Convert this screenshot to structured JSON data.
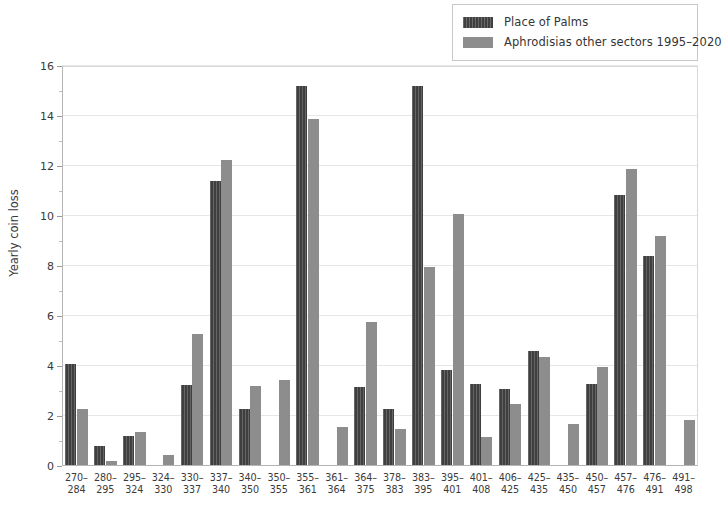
{
  "chart_data": {
    "type": "bar",
    "title": "",
    "xlabel": "",
    "ylabel": "Yearly coin loss",
    "ylim": [
      0,
      16
    ],
    "ytick_step": 2,
    "yticks": [
      0,
      2,
      4,
      6,
      8,
      10,
      12,
      14,
      16
    ],
    "ytick_labels": [
      "0",
      "2",
      "4",
      "6",
      "8",
      "10",
      "12",
      "14",
      "16"
    ],
    "minor_yticks": [
      1,
      3,
      5,
      7,
      9,
      11,
      13,
      15
    ],
    "grid": true,
    "grid_axis": "y",
    "legend_position": "top-right",
    "categories": [
      "270–284",
      "280–295",
      "295–324",
      "324–330",
      "330–337",
      "337–340",
      "340–350",
      "350–355",
      "355–361",
      "361–364",
      "364–375",
      "378–383",
      "383–395",
      "395–401",
      "401–408",
      "406–425",
      "425–435",
      "435–450",
      "450–457",
      "457–476",
      "476–491",
      "491–498"
    ],
    "category_lines": [
      [
        "270–",
        "284"
      ],
      [
        "280–",
        "295"
      ],
      [
        "295–",
        "324"
      ],
      [
        "324–",
        "330"
      ],
      [
        "330–",
        "337"
      ],
      [
        "337–",
        "340"
      ],
      [
        "340–",
        "350"
      ],
      [
        "350–",
        "355"
      ],
      [
        "355–",
        "361"
      ],
      [
        "361–",
        "364"
      ],
      [
        "364–",
        "375"
      ],
      [
        "378–",
        "383"
      ],
      [
        "383–",
        "395"
      ],
      [
        "395–",
        "401"
      ],
      [
        "401–",
        "408"
      ],
      [
        "406–",
        "425"
      ],
      [
        "425–",
        "435"
      ],
      [
        "435–",
        "450"
      ],
      [
        "450–",
        "457"
      ],
      [
        "457–",
        "476"
      ],
      [
        "476–",
        "491"
      ],
      [
        "491–",
        "498"
      ]
    ],
    "series": [
      {
        "name": "Place of Palms",
        "color": "#3f3f3f",
        "values": [
          4.1,
          0.8,
          1.2,
          0,
          3.25,
          11.4,
          2.3,
          0,
          15.2,
          0,
          3.15,
          2.3,
          15.2,
          3.85,
          3.3,
          3.1,
          4.6,
          0,
          3.3,
          10.85,
          8.4,
          0
        ]
      },
      {
        "name": "Aphrodisias other sectors 1995–2020",
        "color": "#8d8d8d",
        "values": [
          2.3,
          0.2,
          1.35,
          0.45,
          5.3,
          12.25,
          3.2,
          3.45,
          13.9,
          1.55,
          5.75,
          1.5,
          7.95,
          10.1,
          1.15,
          2.5,
          4.35,
          1.7,
          3.95,
          11.9,
          9.2,
          1.85
        ]
      }
    ]
  },
  "legend": {
    "entries": [
      {
        "label": "Place of Palms",
        "swatch": "dark"
      },
      {
        "label": "Aphrodisias other sectors 1995–2020",
        "swatch": "light"
      }
    ]
  },
  "axes": {
    "y_title": "Yearly coin loss"
  },
  "caption": {
    "text": ""
  }
}
